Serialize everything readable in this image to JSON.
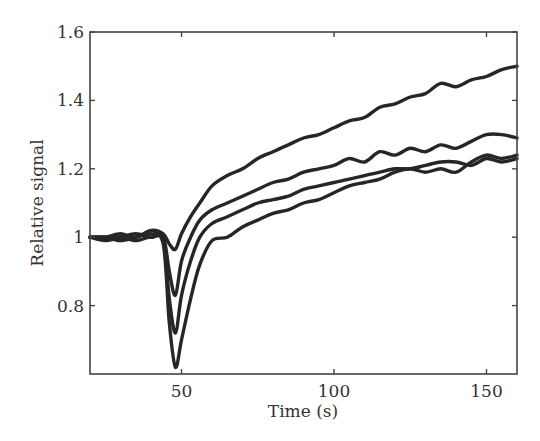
{
  "chart_data": {
    "type": "line",
    "title": "",
    "xlabel": "Time (s)",
    "ylabel": "Relative signal",
    "xlim": [
      20,
      160
    ],
    "ylim": [
      0.6,
      1.6
    ],
    "xticks": [
      50,
      100,
      150
    ],
    "xtick_labels": [
      "50",
      "100",
      "150"
    ],
    "yticks": [
      0.8,
      1.0,
      1.2,
      1.4,
      1.6
    ],
    "ytick_labels": [
      "0.8",
      "1",
      "1.2",
      "1.4",
      "1.6"
    ],
    "grid": false,
    "legend": null,
    "line_color": "#262626",
    "series": [
      {
        "name": "curve-1",
        "x": [
          20,
          25,
          30,
          35,
          40,
          44,
          46,
          48,
          50,
          53,
          56,
          60,
          65,
          70,
          75,
          80,
          85,
          90,
          95,
          100,
          105,
          110,
          115,
          120,
          125,
          130,
          135,
          140,
          145,
          150,
          155,
          160
        ],
        "y": [
          1.0,
          1.0,
          1.01,
          1.0,
          1.02,
          1.01,
          0.98,
          0.965,
          1.01,
          1.06,
          1.1,
          1.15,
          1.18,
          1.2,
          1.23,
          1.25,
          1.27,
          1.29,
          1.3,
          1.32,
          1.34,
          1.35,
          1.38,
          1.39,
          1.41,
          1.42,
          1.45,
          1.44,
          1.46,
          1.47,
          1.49,
          1.5
        ]
      },
      {
        "name": "curve-2",
        "x": [
          20,
          25,
          30,
          35,
          40,
          44,
          46,
          48,
          50,
          53,
          56,
          60,
          65,
          70,
          75,
          80,
          85,
          90,
          95,
          100,
          105,
          110,
          115,
          120,
          125,
          130,
          135,
          140,
          145,
          150,
          155,
          160
        ],
        "y": [
          1.0,
          0.99,
          1.0,
          1.01,
          1.0,
          1.0,
          0.9,
          0.83,
          0.93,
          1.0,
          1.05,
          1.08,
          1.1,
          1.12,
          1.14,
          1.16,
          1.17,
          1.19,
          1.2,
          1.21,
          1.23,
          1.22,
          1.25,
          1.24,
          1.26,
          1.25,
          1.27,
          1.26,
          1.28,
          1.3,
          1.3,
          1.29
        ]
      },
      {
        "name": "curve-3",
        "x": [
          20,
          25,
          30,
          35,
          40,
          44,
          46,
          48,
          50,
          53,
          56,
          60,
          65,
          70,
          75,
          80,
          85,
          90,
          95,
          100,
          105,
          110,
          115,
          120,
          125,
          130,
          135,
          140,
          145,
          150,
          155,
          160
        ],
        "y": [
          1.0,
          1.0,
          0.99,
          1.0,
          1.01,
          0.99,
          0.82,
          0.72,
          0.83,
          0.93,
          1.0,
          1.04,
          1.06,
          1.08,
          1.1,
          1.11,
          1.12,
          1.14,
          1.15,
          1.16,
          1.17,
          1.18,
          1.19,
          1.2,
          1.2,
          1.21,
          1.22,
          1.22,
          1.21,
          1.23,
          1.22,
          1.23
        ]
      },
      {
        "name": "curve-4",
        "x": [
          20,
          25,
          30,
          35,
          40,
          44,
          46,
          48,
          50,
          53,
          56,
          60,
          65,
          70,
          75,
          80,
          85,
          90,
          95,
          100,
          105,
          110,
          115,
          120,
          125,
          130,
          135,
          140,
          145,
          150,
          155,
          160
        ],
        "y": [
          1.0,
          1.0,
          1.0,
          0.99,
          1.0,
          0.98,
          0.75,
          0.62,
          0.7,
          0.82,
          0.92,
          0.99,
          1.0,
          1.03,
          1.05,
          1.07,
          1.08,
          1.1,
          1.11,
          1.13,
          1.15,
          1.16,
          1.17,
          1.19,
          1.2,
          1.19,
          1.2,
          1.19,
          1.22,
          1.24,
          1.23,
          1.24
        ]
      }
    ]
  },
  "plot_box": {
    "left": 90,
    "top": 32,
    "right": 517,
    "bottom": 374
  }
}
